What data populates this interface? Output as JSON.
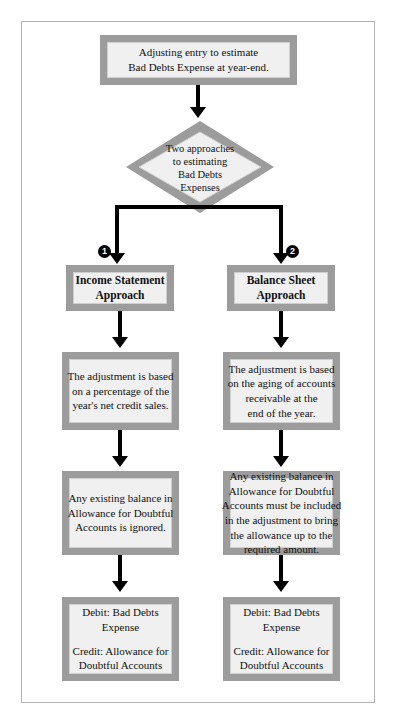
{
  "diagram": {
    "title": "Adjusting entry to estimate Bad Debts Expense at year-end.",
    "start": {
      "line1": "Adjusting entry to estimate",
      "line2": "Bad Debts Expense at year-end."
    },
    "decision": {
      "line1": "Two approaches",
      "line2": "to estimating",
      "line3": "Bad Debts",
      "line4": "Expenses"
    },
    "branches": [
      {
        "marker": "1",
        "heading": {
          "line1": "Income Statement",
          "line2": "Approach"
        },
        "basis": {
          "line1": "The adjustment is based",
          "line2": "on a percentage of the",
          "line3": "year's net credit sales."
        },
        "existing_balance": {
          "line1": "Any existing balance in",
          "line2": "Allowance for Doubtful",
          "line3": "Accounts is ignored."
        },
        "entry": {
          "debit": "Debit: Bad Debts Expense",
          "credit_line1": "Credit: Allowance for",
          "credit_line2": "Doubtful Accounts"
        }
      },
      {
        "marker": "2",
        "heading": {
          "line1": "Balance Sheet",
          "line2": "Approach"
        },
        "basis": {
          "line1": "The adjustment is based",
          "line2": "on the aging of accounts",
          "line3": "receivable at the",
          "line4": "end of the year."
        },
        "existing_balance": {
          "line1": "Any existing balance in",
          "line2": "Allowance for Doubtful",
          "line3": "Accounts must be included",
          "line4": "in the adjustment to bring",
          "line5": "the allowance up to the",
          "line6": "required amount."
        },
        "entry": {
          "debit": "Debit: Bad Debts Expense",
          "credit_line1": "Credit: Allowance for",
          "credit_line2": "Doubtful Accounts"
        }
      }
    ],
    "colors": {
      "border_band": "#9c9c9c",
      "node_fill": "#eff0ef",
      "connector": "#000000",
      "frame": "#b4b4b4",
      "badge": "#000000"
    }
  }
}
